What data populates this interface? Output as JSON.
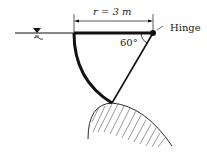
{
  "diagram": {
    "radius_label": "r = 3 m",
    "angle_label": "60°",
    "hinge_label": "Hinge",
    "water_symbol": "free-surface-triangle",
    "colors": {
      "stroke": "#111111",
      "hatch": "#555555",
      "background": "#ffffff"
    }
  }
}
